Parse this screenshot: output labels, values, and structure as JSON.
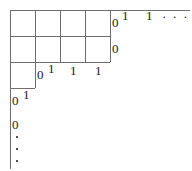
{
  "figure": {
    "type": "lattice-staircase-diagram",
    "background_color": "#ffffff",
    "line_color": "#6e6e6e",
    "text_color": "#1a1a1a",
    "width": 192,
    "height": 171,
    "top_row_labels": {
      "edge_zero": "0",
      "first_one": "1",
      "second_one": "1",
      "ellipsis": "· · ·"
    },
    "second_row_labels": {
      "edge_zero": "0"
    },
    "third_row_labels": {
      "edge_zero": "0",
      "corner_one": "1",
      "cell_one_a": "1",
      "cell_one_b": "1",
      "cell_one_c": "1"
    },
    "fourth_row_labels": {
      "edge_zero": "0",
      "corner_one": "1"
    },
    "bottom_labels": {
      "edge_zero": "0",
      "vertical_ellipsis": "⋮"
    },
    "grid": {
      "columns": 4,
      "rows": 3,
      "cell_width": 25,
      "cell_height": 26,
      "origin_x": 10,
      "origin_y": 10
    }
  }
}
